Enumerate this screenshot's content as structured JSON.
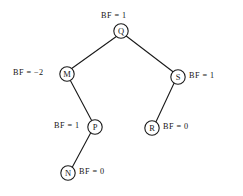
{
  "diagram": {
    "type": "avl-binary-search-tree",
    "colors": {
      "background": "#ffffff",
      "stroke": "#1a1a1a",
      "text": "#141414",
      "node_fill": "#ffffff"
    },
    "nodes": [
      {
        "id": "Q",
        "key": "Q",
        "cx": 121,
        "cy": 31,
        "r": 7.2,
        "balance_factor": "BF = 1",
        "label_position": "above"
      },
      {
        "id": "M",
        "key": "M",
        "cx": 67,
        "cy": 74,
        "r": 7.2,
        "balance_factor": "BF = −2",
        "label_position": "left"
      },
      {
        "id": "S",
        "key": "S",
        "cx": 178,
        "cy": 77,
        "r": 7.2,
        "balance_factor": "BF = 1",
        "label_position": "right"
      },
      {
        "id": "P",
        "key": "P",
        "cx": 95,
        "cy": 127,
        "r": 7.2,
        "balance_factor": "BF = 1",
        "label_position": "left"
      },
      {
        "id": "R",
        "key": "R",
        "cx": 152,
        "cy": 128,
        "r": 7.2,
        "balance_factor": "BF = 0",
        "label_position": "right"
      },
      {
        "id": "N",
        "key": "N",
        "cx": 68,
        "cy": 173,
        "r": 7.2,
        "balance_factor": "BF = 0",
        "label_position": "right"
      }
    ],
    "edges": [
      {
        "from": "Q",
        "to": "M",
        "side": "left"
      },
      {
        "from": "Q",
        "to": "S",
        "side": "right"
      },
      {
        "from": "M",
        "to": "P",
        "side": "right"
      },
      {
        "from": "P",
        "to": "N",
        "side": "left"
      },
      {
        "from": "S",
        "to": "R",
        "side": "left"
      }
    ],
    "labels": {
      "q_bf": {
        "text": "BF = 1",
        "x": 101,
        "y": 12
      },
      "m_bf": {
        "text": "BF = −2",
        "x": 13,
        "y": 69
      },
      "s_bf": {
        "text": "BF = 1",
        "x": 189,
        "y": 72
      },
      "p_bf": {
        "text": "BF = 1",
        "x": 54,
        "y": 122
      },
      "r_bf": {
        "text": "BF = 0",
        "x": 163,
        "y": 123
      },
      "n_bf": {
        "text": "BF = 0",
        "x": 79,
        "y": 168
      }
    }
  }
}
